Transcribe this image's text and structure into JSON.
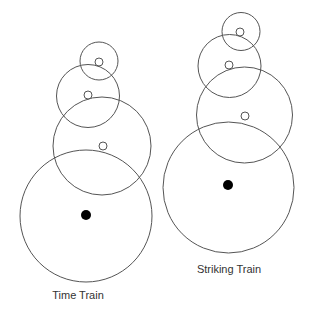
{
  "diagram": {
    "trains": [
      {
        "id": "time-train",
        "label": "Time Train",
        "wheel_count": 4,
        "colors": {
          "stroke": "#555555",
          "center_dot": "#000000"
        }
      },
      {
        "id": "striking-train",
        "label": "Striking Train",
        "wheel_count": 4,
        "colors": {
          "stroke": "#555555",
          "center_dot": "#000000"
        }
      }
    ]
  }
}
